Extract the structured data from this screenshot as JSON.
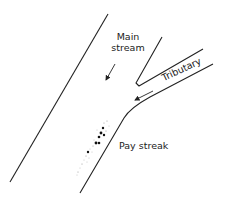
{
  "diagram": {
    "labels": {
      "main_stream_line1": "Main",
      "main_stream_line2": "stream",
      "tributary": "Tributary",
      "pay_streak": "Pay streak"
    },
    "colors": {
      "line": "#222222",
      "dots": "#111111",
      "background": "#ffffff"
    },
    "elements": {
      "main_stream_left_bank": {
        "x1": 108,
        "y1": 14,
        "x2": 10,
        "y2": 182
      },
      "tributary_upper_bank": [
        [
          162,
          37
        ],
        [
          136,
          84
        ],
        [
          139,
          86
        ],
        [
          203,
          49
        ]
      ],
      "tributary_lower_bank": [
        [
          213,
          64
        ],
        [
          150,
          97
        ],
        [
          128,
          112
        ],
        [
          80,
          193
        ]
      ],
      "main_flow_arrow": {
        "from": [
          115,
          64
        ],
        "to": [
          105,
          82
        ]
      },
      "tributary_flow_arrow": {
        "from": [
          153,
          91
        ],
        "to": [
          133,
          101
        ]
      }
    }
  }
}
